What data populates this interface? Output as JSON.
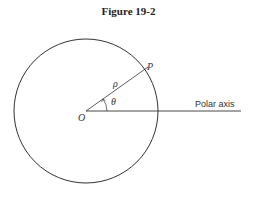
{
  "figure": {
    "title": "Figure 19-2",
    "labels": {
      "origin": "O",
      "point": "P",
      "radius": "ρ",
      "angle": "θ",
      "axis": "Polar axis"
    },
    "colors": {
      "stroke": "#333333",
      "background": "#ffffff"
    }
  }
}
